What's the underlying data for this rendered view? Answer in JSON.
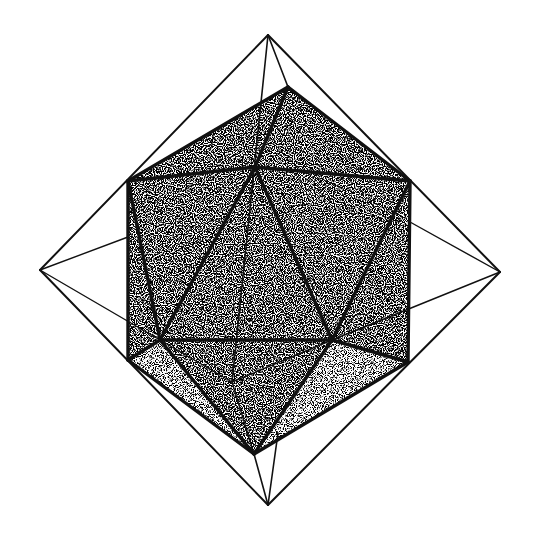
{
  "figure": {
    "background": "#ffffff",
    "stroke": "#111111",
    "octahedron": {
      "vertices": {
        "top": [
          268,
          35
        ],
        "bottom": [
          268,
          505
        ],
        "left": [
          40,
          270
        ],
        "right": [
          500,
          272
        ]
      },
      "outer_edges": [
        [
          "top",
          "left"
        ],
        [
          "top",
          "right"
        ],
        [
          "bottom",
          "left"
        ],
        [
          "bottom",
          "right"
        ]
      ]
    },
    "icosahedron": {
      "vertices": {
        "A": [
          288,
          87
        ],
        "B": [
          128,
          181
        ],
        "C": [
          255,
          167
        ],
        "D": [
          410,
          181
        ],
        "E": [
          128,
          360
        ],
        "F": [
          160,
          340
        ],
        "G": [
          332,
          340
        ],
        "H": [
          408,
          362
        ],
        "I": [
          254,
          454
        ],
        "J": [
          232,
          382
        ]
      }
    }
  }
}
